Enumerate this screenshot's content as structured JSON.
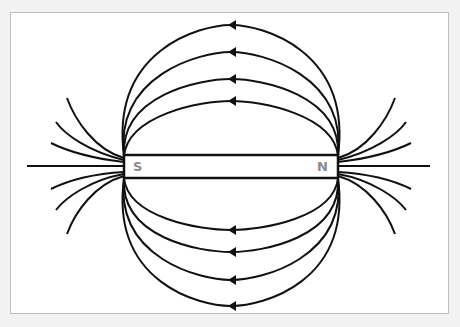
{
  "diagram": {
    "magnet": {
      "south_label": "S",
      "north_label": "N"
    },
    "colors": {
      "background": "#f2f2f2",
      "panel": "#ffffff",
      "lines": "#111111",
      "labels": "#8a8a8a"
    },
    "field_line_direction": "N to S (arrows point left over the top and bottom loops)",
    "loops_above": 4,
    "loops_below": 4,
    "short_lines_per_pole": 6
  }
}
